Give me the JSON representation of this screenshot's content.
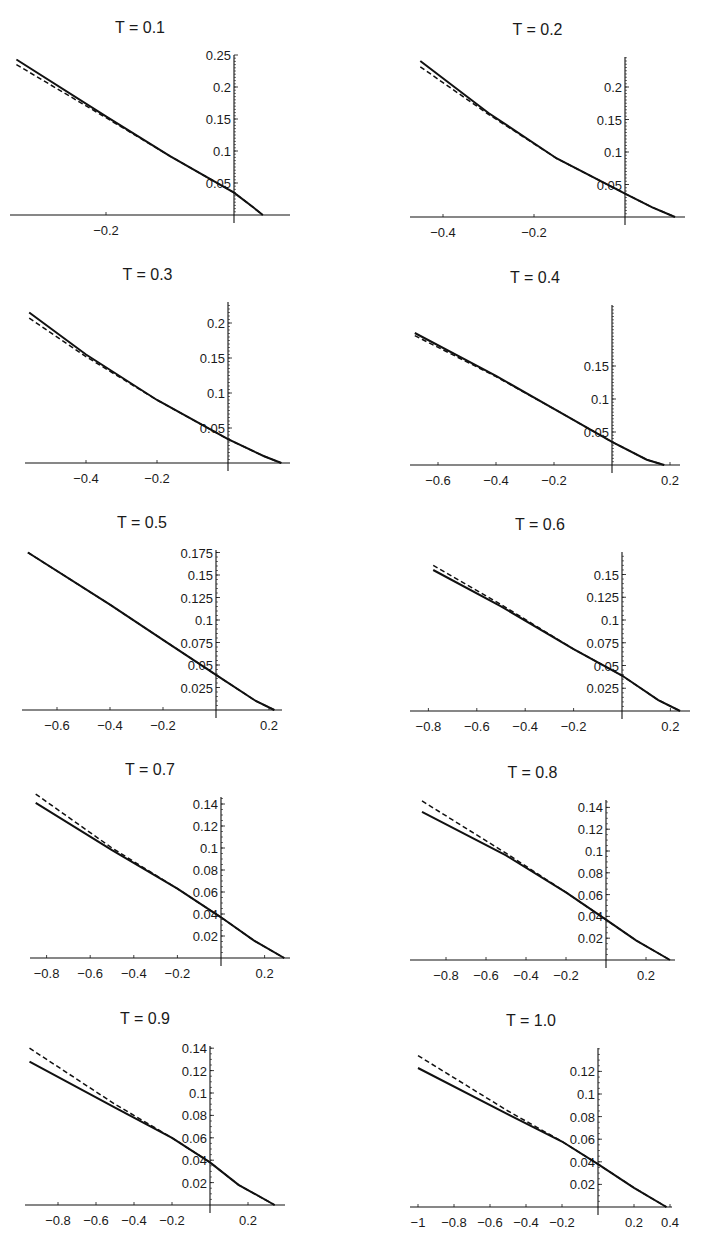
{
  "chart_data": [
    {
      "type": "line",
      "title": "T = 0.1",
      "panel": {
        "x0": 234,
        "y0": 215,
        "sx": 640,
        "sy": 640,
        "top": 55,
        "left": 10,
        "right": 290
      },
      "xticks": [
        -0.2
      ],
      "xtick_labels": [
        "−0.2"
      ],
      "yticks": [
        0.05,
        0.1,
        0.15,
        0.2,
        0.25
      ],
      "ytick_labels": [
        "0.05",
        "0.1",
        "0.15",
        "0.2",
        "0.25"
      ],
      "series": [
        {
          "name": "solid",
          "style": "solid",
          "x": [
            -0.34,
            -0.2,
            -0.1,
            0,
            0.03,
            0.045
          ],
          "y": [
            0.243,
            0.154,
            0.092,
            0.035,
            0.012,
            0.0
          ]
        },
        {
          "name": "dashed",
          "style": "dashed",
          "x": [
            -0.34,
            -0.2,
            -0.1,
            0,
            0.03,
            0.045
          ],
          "y": [
            0.235,
            0.152,
            0.092,
            0.035,
            0.012,
            0.0
          ]
        }
      ]
    },
    {
      "type": "line",
      "title": "T = 0.2",
      "panel": {
        "x0": 625,
        "y0": 217,
        "sx": 455,
        "sy": 650,
        "top": 57,
        "left": 410,
        "right": 685
      },
      "xticks": [
        -0.4,
        -0.2
      ],
      "xtick_labels": [
        "−0.4",
        "−0.2"
      ],
      "yticks": [
        0.05,
        0.1,
        0.15,
        0.2
      ],
      "ytick_labels": [
        "0.05",
        "0.1",
        "0.15",
        "0.2"
      ],
      "series": [
        {
          "name": "solid",
          "style": "solid",
          "x": [
            -0.45,
            -0.3,
            -0.15,
            0,
            0.06,
            0.11
          ],
          "y": [
            0.24,
            0.16,
            0.09,
            0.036,
            0.015,
            0.0
          ]
        },
        {
          "name": "dashed",
          "style": "dashed",
          "x": [
            -0.45,
            -0.3,
            -0.15,
            0,
            0.06,
            0.11
          ],
          "y": [
            0.231,
            0.158,
            0.09,
            0.036,
            0.015,
            0.0
          ]
        }
      ]
    },
    {
      "type": "line",
      "title": "T = 0.3",
      "panel": {
        "x0": 228,
        "y0": 463,
        "sx": 355,
        "sy": 700,
        "top": 302,
        "left": 25,
        "right": 290
      },
      "xticks": [
        -0.4,
        -0.2
      ],
      "xtick_labels": [
        "−0.4",
        "−0.2"
      ],
      "yticks": [
        0.05,
        0.1,
        0.15,
        0.2
      ],
      "ytick_labels": [
        "0.05",
        "0.1",
        "0.15",
        "0.2"
      ],
      "series": [
        {
          "name": "solid",
          "style": "solid",
          "x": [
            -0.56,
            -0.4,
            -0.2,
            0,
            0.1,
            0.15
          ],
          "y": [
            0.215,
            0.155,
            0.09,
            0.034,
            0.01,
            0.0
          ]
        },
        {
          "name": "dashed",
          "style": "dashed",
          "x": [
            -0.56,
            -0.4,
            -0.2,
            0,
            0.1,
            0.15
          ],
          "y": [
            0.207,
            0.152,
            0.09,
            0.034,
            0.01,
            0.0
          ]
        }
      ]
    },
    {
      "type": "line",
      "title": "T = 0.4",
      "panel": {
        "x0": 612,
        "y0": 465,
        "sx": 290,
        "sy": 660,
        "top": 305,
        "left": 410,
        "right": 680
      },
      "xticks": [
        -0.6,
        -0.4,
        -0.2,
        0.2
      ],
      "xtick_labels": [
        "−0.6",
        "−0.4",
        "−0.2",
        "0.2"
      ],
      "yticks": [
        0.05,
        0.1,
        0.15
      ],
      "ytick_labels": [
        "0.05",
        "0.1",
        "0.15"
      ],
      "series": [
        {
          "name": "solid",
          "style": "solid",
          "x": [
            -0.68,
            -0.4,
            -0.2,
            0,
            0.12,
            0.18
          ],
          "y": [
            0.2,
            0.135,
            0.085,
            0.035,
            0.008,
            0.0
          ]
        },
        {
          "name": "dashed",
          "style": "dashed",
          "x": [
            -0.68,
            -0.4,
            -0.2,
            0,
            0.12,
            0.18
          ],
          "y": [
            0.196,
            0.134,
            0.085,
            0.035,
            0.008,
            0.0
          ]
        }
      ]
    },
    {
      "type": "line",
      "title": "T = 0.5",
      "panel": {
        "x0": 216,
        "y0": 710,
        "sx": 265,
        "sy": 900,
        "top": 550,
        "left": 22,
        "right": 282
      },
      "xticks": [
        -0.6,
        -0.4,
        -0.2,
        0.2
      ],
      "xtick_labels": [
        "−0.6",
        "−0.4",
        "−0.2",
        "0.2"
      ],
      "yticks": [
        0.025,
        0.05,
        0.075,
        0.1,
        0.125,
        0.15,
        0.175
      ],
      "ytick_labels": [
        "0.025",
        "0.05",
        "0.075",
        "0.1",
        "0.125",
        "0.15",
        "0.175"
      ],
      "series": [
        {
          "name": "solid",
          "style": "solid",
          "x": [
            -0.71,
            -0.4,
            -0.2,
            0,
            0.15,
            0.22
          ],
          "y": [
            0.175,
            0.117,
            0.078,
            0.039,
            0.01,
            0.0
          ]
        },
        {
          "name": "dashed",
          "style": "dashed",
          "x": [
            -0.71,
            -0.4,
            -0.2,
            0,
            0.15,
            0.22
          ],
          "y": [
            0.175,
            0.117,
            0.078,
            0.039,
            0.01,
            0.0
          ]
        }
      ]
    },
    {
      "type": "line",
      "title": "T = 0.6",
      "panel": {
        "x0": 622,
        "y0": 711,
        "sx": 242,
        "sy": 910,
        "top": 552,
        "left": 410,
        "right": 690
      },
      "xticks": [
        -0.8,
        -0.6,
        -0.4,
        -0.2,
        0.2
      ],
      "xtick_labels": [
        "−0.8",
        "−0.6",
        "−0.4",
        "−0.2",
        "0.2"
      ],
      "yticks": [
        0.025,
        0.05,
        0.075,
        0.1,
        0.125,
        0.15
      ],
      "ytick_labels": [
        "0.025",
        "0.05",
        "0.075",
        "0.1",
        "0.125",
        "0.15"
      ],
      "series": [
        {
          "name": "solid",
          "style": "solid",
          "x": [
            -0.78,
            -0.5,
            -0.2,
            0,
            0.15,
            0.24
          ],
          "y": [
            0.155,
            0.115,
            0.068,
            0.039,
            0.012,
            0.0
          ]
        },
        {
          "name": "dashed",
          "style": "dashed",
          "x": [
            -0.78,
            -0.5,
            -0.2,
            0,
            0.15,
            0.24
          ],
          "y": [
            0.16,
            0.117,
            0.068,
            0.039,
            0.012,
            0.0
          ]
        }
      ]
    },
    {
      "type": "line",
      "title": "T = 0.7",
      "panel": {
        "x0": 221,
        "y0": 958,
        "sx": 218,
        "sy": 1100,
        "top": 797,
        "left": 30,
        "right": 290
      },
      "xticks": [
        -0.8,
        -0.6,
        -0.4,
        -0.2,
        0.2
      ],
      "xtick_labels": [
        "−0.8",
        "−0.6",
        "−0.4",
        "−0.2",
        "0.2"
      ],
      "yticks": [
        0.02,
        0.04,
        0.06,
        0.08,
        0.1,
        0.12,
        0.14
      ],
      "ytick_labels": [
        "0.02",
        "0.04",
        "0.06",
        "0.08",
        "0.1",
        "0.12",
        "0.14"
      ],
      "series": [
        {
          "name": "solid",
          "style": "solid",
          "x": [
            -0.85,
            -0.5,
            -0.2,
            0,
            0.15,
            0.29
          ],
          "y": [
            0.141,
            0.098,
            0.063,
            0.037,
            0.016,
            0.0
          ]
        },
        {
          "name": "dashed",
          "style": "dashed",
          "x": [
            -0.85,
            -0.5,
            -0.2,
            0,
            0.15,
            0.29
          ],
          "y": [
            0.149,
            0.1,
            0.063,
            0.037,
            0.016,
            0.0
          ]
        }
      ]
    },
    {
      "type": "line",
      "title": "T = 0.8",
      "panel": {
        "x0": 606,
        "y0": 960,
        "sx": 200,
        "sy": 1090,
        "top": 800,
        "left": 410,
        "right": 675
      },
      "xticks": [
        -0.8,
        -0.6,
        -0.4,
        -0.2,
        0.2
      ],
      "xtick_labels": [
        "−0.8",
        "−0.6",
        "−0.4",
        "−0.2",
        "0.2"
      ],
      "yticks": [
        0.02,
        0.04,
        0.06,
        0.08,
        0.1,
        0.12,
        0.14
      ],
      "ytick_labels": [
        "0.02",
        "0.04",
        "0.06",
        "0.08",
        "0.1",
        "0.12",
        "0.14"
      ],
      "series": [
        {
          "name": "solid",
          "style": "solid",
          "x": [
            -0.92,
            -0.5,
            -0.2,
            0,
            0.15,
            0.32
          ],
          "y": [
            0.136,
            0.096,
            0.062,
            0.037,
            0.018,
            0.0
          ]
        },
        {
          "name": "dashed",
          "style": "dashed",
          "x": [
            -0.92,
            -0.5,
            -0.2,
            0,
            0.15,
            0.32
          ],
          "y": [
            0.146,
            0.098,
            0.062,
            0.037,
            0.018,
            0.0
          ]
        }
      ]
    },
    {
      "type": "line",
      "title": "T = 0.9",
      "panel": {
        "x0": 210,
        "y0": 1205,
        "sx": 190,
        "sy": 1120,
        "top": 1046,
        "left": 25,
        "right": 285
      },
      "xticks": [
        -0.8,
        -0.6,
        -0.4,
        -0.2,
        0.2
      ],
      "xtick_labels": [
        "−0.8",
        "−0.6",
        "−0.4",
        "−0.2",
        "0.2"
      ],
      "yticks": [
        0.02,
        0.04,
        0.06,
        0.08,
        0.1,
        0.12,
        0.14
      ],
      "ytick_labels": [
        "0.02",
        "0.04",
        "0.06",
        "0.08",
        "0.1",
        "0.12",
        "0.14"
      ],
      "series": [
        {
          "name": "solid",
          "style": "solid",
          "x": [
            -0.95,
            -0.5,
            -0.2,
            0,
            0.15,
            0.34
          ],
          "y": [
            0.128,
            0.087,
            0.06,
            0.038,
            0.018,
            0.0
          ]
        },
        {
          "name": "dashed",
          "style": "dashed",
          "x": [
            -0.95,
            -0.5,
            -0.2,
            0,
            0.15,
            0.34
          ],
          "y": [
            0.14,
            0.09,
            0.06,
            0.038,
            0.018,
            0.0
          ]
        }
      ]
    },
    {
      "type": "line",
      "title": "T = 1.0",
      "panel": {
        "x0": 598,
        "y0": 1207,
        "sx": 180,
        "sy": 1130,
        "top": 1048,
        "left": 410,
        "right": 672
      },
      "xticks": [
        -1,
        -0.8,
        -0.6,
        -0.4,
        -0.2,
        0.2,
        0.4
      ],
      "xtick_labels": [
        "−1",
        "−0.8",
        "−0.6",
        "−0.4",
        "−0.2",
        "0.2",
        "0.4"
      ],
      "yticks": [
        0.02,
        0.04,
        0.06,
        0.08,
        0.1,
        0.12
      ],
      "ytick_labels": [
        "0.02",
        "0.04",
        "0.06",
        "0.08",
        "0.1",
        "0.12"
      ],
      "series": [
        {
          "name": "solid",
          "style": "solid",
          "x": [
            -1.0,
            -0.5,
            -0.2,
            0,
            0.2,
            0.38
          ],
          "y": [
            0.123,
            0.082,
            0.058,
            0.038,
            0.017,
            0.0
          ]
        },
        {
          "name": "dashed",
          "style": "dashed",
          "x": [
            -1.0,
            -0.5,
            -0.2,
            0,
            0.2,
            0.38
          ],
          "y": [
            0.134,
            0.085,
            0.058,
            0.038,
            0.017,
            0.0
          ]
        }
      ]
    }
  ],
  "figure": {
    "layout": "5 rows x 2 columns",
    "line_color": "#111111",
    "background": "#ffffff"
  }
}
